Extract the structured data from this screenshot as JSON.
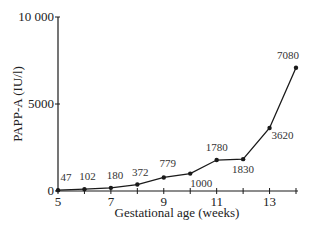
{
  "chart_data": {
    "type": "line",
    "title": "",
    "xlabel": "Gestational age (weeks)",
    "ylabel": "PAPP-A (IU/l)",
    "x": [
      5,
      6,
      7,
      8,
      9,
      10,
      11,
      12,
      13,
      14
    ],
    "series": [
      {
        "name": "PAPP-A",
        "values": [
          47,
          102,
          180,
          372,
          779,
          1000,
          1780,
          1830,
          3620,
          7080
        ]
      }
    ],
    "point_labels": [
      "47",
      "102",
      "180",
      "372",
      "779",
      "1000",
      "1780",
      "1830",
      "3620",
      "7080"
    ],
    "xlim": [
      5,
      14
    ],
    "ylim": [
      0,
      10000
    ],
    "x_ticks": [
      5,
      6,
      7,
      8,
      9,
      10,
      11,
      12,
      13,
      14
    ],
    "x_tick_labels": [
      "5",
      "7",
      "9",
      "11",
      "13"
    ],
    "x_tick_label_values": [
      5,
      7,
      9,
      11,
      13
    ],
    "y_ticks": [
      0,
      5000,
      10000
    ],
    "y_tick_labels": [
      "0",
      "5000",
      "10 000"
    ],
    "grid": false,
    "legend": "none",
    "colors": {
      "line": "#1a1a1a",
      "marker": "#1a1a1a",
      "axis": "#1a1a1a"
    }
  }
}
